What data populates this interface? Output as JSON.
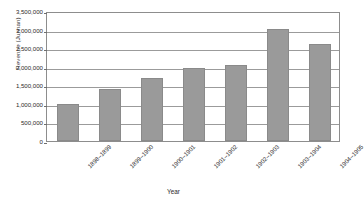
{
  "chart_data": {
    "type": "bar",
    "title": "",
    "xlabel": "Year",
    "ylabel": "Revenue (Junnan)",
    "categories": [
      "1898–1899",
      "1899–1900",
      "1900–1901",
      "1901–1902",
      "1902–1903",
      "1903–1904",
      "1904–1905"
    ],
    "values": [
      1000000,
      1400000,
      1700000,
      1975000,
      2050000,
      3025000,
      2600000
    ],
    "series": [
      {
        "name": "Revenue",
        "values": [
          1000000,
          1400000,
          1700000,
          1975000,
          2050000,
          3025000,
          2600000
        ]
      }
    ],
    "ylim": [
      0,
      3500000
    ],
    "ytick_values": [
      0,
      500000,
      1000000,
      1500000,
      2000000,
      2500000,
      3000000,
      3500000
    ],
    "ytick_labels": [
      "0",
      "500,000",
      "1,000,000",
      "1,500,000",
      "2,000,000",
      "2,500,000",
      "3,000,000",
      "3,500,000"
    ],
    "grid": true,
    "legend": false,
    "legend_position": "none",
    "bar_color": "#9a9a9a",
    "bar_border_color": "#8a8a8a",
    "gridline_color": "#9b9b9b",
    "plot_border_color": "#8d8d8d",
    "background_color": "#ffffff",
    "xtick_rotation": -45
  }
}
